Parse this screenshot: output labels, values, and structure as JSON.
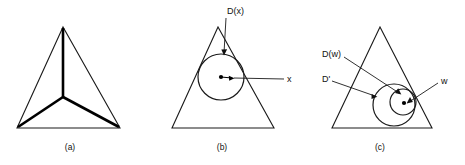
{
  "figure": {
    "background_color": "#ffffff",
    "line_color": "#1a1a1a",
    "width": 465,
    "height": 165
  },
  "panels": [
    {
      "id": "a",
      "caption": "(a)",
      "caption_x": 70,
      "caption_y": 150,
      "description": "triangle with medial axis skeleton",
      "shape": "triangle",
      "triangle": {
        "apex": [
          63,
          27
        ],
        "left": [
          17,
          128
        ],
        "right": [
          120,
          128
        ]
      },
      "medial_axis": {
        "center": [
          63,
          97
        ],
        "branches": [
          [
            63,
            27
          ],
          [
            17,
            128
          ],
          [
            120,
            128
          ]
        ]
      },
      "labels": []
    },
    {
      "id": "b",
      "caption": "(b)",
      "caption_x": 222,
      "caption_y": 150,
      "description": "triangle with maximal inscribed disk D(x) centered at x",
      "shape": "triangle",
      "triangle": {
        "apex": [
          218,
          27
        ],
        "left": [
          172,
          128
        ],
        "right": [
          274,
          128
        ]
      },
      "disks": [
        {
          "name": "D(x)",
          "center": [
            221,
            77
          ],
          "radius": 23
        }
      ],
      "points": [
        {
          "name": "x",
          "position": [
            221,
            77
          ]
        }
      ],
      "labels": [
        {
          "id": "disk-label",
          "text": "D(x)",
          "x": 227,
          "y": 12,
          "anchor": "start",
          "leader_from": [
            226,
            18
          ],
          "leader_to": [
            224,
            53
          ]
        },
        {
          "id": "point-label",
          "text": "x",
          "x": 287,
          "y": 80,
          "anchor": "start",
          "leader_from": [
            284,
            79
          ],
          "leader_to": [
            232,
            78
          ]
        }
      ]
    },
    {
      "id": "c",
      "caption": "(c)",
      "caption_x": 380,
      "caption_y": 150,
      "description": "triangle with two nested disks D' and D(w), point w",
      "shape": "triangle",
      "triangle": {
        "apex": [
          380,
          27
        ],
        "left": [
          332,
          128
        ],
        "right": [
          432,
          128
        ]
      },
      "disks": [
        {
          "name": "D'",
          "center": [
            394,
            105
          ],
          "radius": 21
        },
        {
          "name": "D(w)",
          "center": [
            403,
            102
          ],
          "radius": 13
        }
      ],
      "points": [
        {
          "name": "w",
          "position": [
            404,
            103
          ]
        }
      ],
      "labels": [
        {
          "id": "disk-dw-label",
          "text": "D(w)",
          "x": 322,
          "y": 55,
          "anchor": "start",
          "leader_from": [
            344,
            57
          ],
          "leader_to": [
            399,
            93
          ]
        },
        {
          "id": "disk-dprime-label",
          "text": "D'",
          "x": 322,
          "y": 80,
          "anchor": "start",
          "leader_from": [
            332,
            81
          ],
          "leader_to": [
            375,
            96
          ]
        },
        {
          "id": "point-w-label",
          "text": "w",
          "x": 441,
          "y": 82,
          "anchor": "start",
          "leader_from": [
            438,
            83
          ],
          "leader_to": [
            409,
            102
          ]
        }
      ]
    }
  ]
}
